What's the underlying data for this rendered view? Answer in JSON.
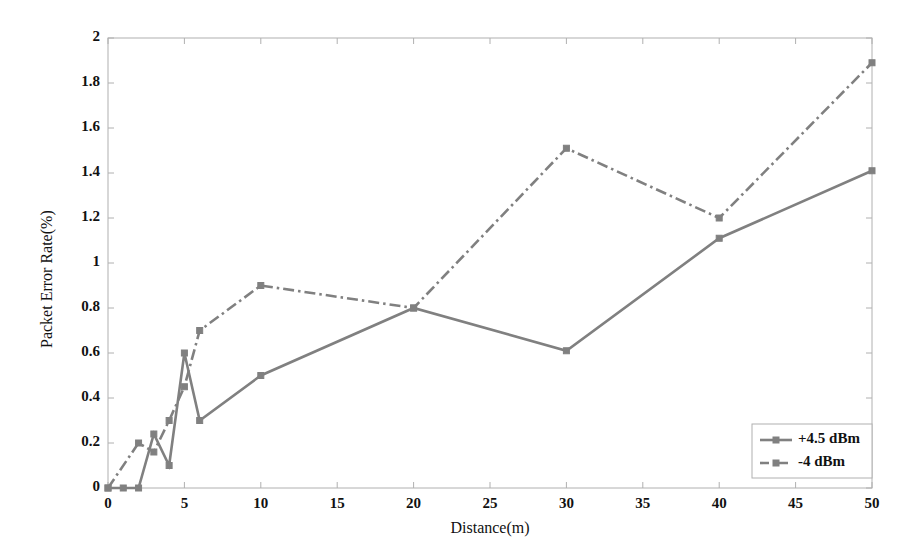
{
  "chart_data": {
    "type": "line",
    "title": "",
    "xlabel": "Distance(m)",
    "ylabel": "Packet Error Rate(%)",
    "xlim": [
      0,
      50
    ],
    "ylim": [
      0,
      2
    ],
    "xticks": [
      0,
      5,
      10,
      15,
      20,
      25,
      30,
      35,
      40,
      45,
      50
    ],
    "xtick_labels": [
      "0",
      "5",
      "10",
      "15",
      "20",
      "25",
      "30",
      "35",
      "40",
      "45",
      "50"
    ],
    "yticks": [
      0,
      0.2,
      0.4,
      0.6,
      0.8,
      1,
      1.2,
      1.4,
      1.6,
      1.8,
      2
    ],
    "ytick_labels": [
      "0",
      "0.2",
      "0.4",
      "0.6",
      "0.8",
      "1",
      "1.2",
      "1.4",
      "1.6",
      "1.8",
      "2"
    ],
    "grid": false,
    "legend_position": "lower right",
    "line_color": "#808080",
    "axis_color": "#b0b0b0",
    "series": [
      {
        "name": "+4.5 dBm",
        "style": "solid",
        "marker": "square",
        "x": [
          0,
          1,
          2,
          3,
          4,
          5,
          6,
          10,
          20,
          30,
          40,
          50
        ],
        "values": [
          0,
          0,
          0,
          0.24,
          0.1,
          0.6,
          0.3,
          0.5,
          0.8,
          0.61,
          1.11,
          1.41
        ]
      },
      {
        "name": "-4 dBm",
        "style": "dashdot",
        "marker": "square",
        "x": [
          0,
          2,
          3,
          4,
          5,
          6,
          10,
          20,
          30,
          40,
          50
        ],
        "values": [
          0,
          0.2,
          0.16,
          0.3,
          0.45,
          0.7,
          0.9,
          0.8,
          1.51,
          1.2,
          1.89
        ]
      }
    ]
  },
  "legend": {
    "entries": [
      {
        "label": "+4.5 dBm"
      },
      {
        "label": "-4 dBm"
      }
    ]
  }
}
